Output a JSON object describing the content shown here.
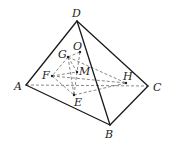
{
  "diagram": {
    "colors": {
      "solid_edge": "#1a1a1a",
      "dashed_edge": "#6a6a6a",
      "label": "#222222",
      "background": "#ffffff"
    },
    "points": {
      "A": {
        "label": "A",
        "x": 26,
        "y": 85
      },
      "B": {
        "label": "B",
        "x": 110,
        "y": 125
      },
      "C": {
        "label": "C",
        "x": 148,
        "y": 86
      },
      "D": {
        "label": "D",
        "x": 77,
        "y": 21
      },
      "O": {
        "label": "O",
        "x": 80,
        "y": 52
      },
      "G": {
        "label": "G",
        "x": 68,
        "y": 57
      },
      "M": {
        "label": "M",
        "x": 77,
        "y": 72
      },
      "F": {
        "label": "F",
        "x": 52,
        "y": 76
      },
      "H": {
        "label": "H",
        "x": 126,
        "y": 83
      },
      "E": {
        "label": "E",
        "x": 74,
        "y": 95
      }
    },
    "solid_edges": [
      [
        "D",
        "A"
      ],
      [
        "D",
        "B"
      ],
      [
        "D",
        "C"
      ],
      [
        "A",
        "B"
      ],
      [
        "B",
        "C"
      ]
    ],
    "dashed_edges": [
      [
        "A",
        "C"
      ],
      [
        "G",
        "O"
      ],
      [
        "O",
        "M"
      ],
      [
        "G",
        "F"
      ],
      [
        "G",
        "M"
      ],
      [
        "G",
        "E"
      ],
      [
        "G",
        "H"
      ],
      [
        "F",
        "H"
      ],
      [
        "F",
        "E"
      ],
      [
        "F",
        "M"
      ],
      [
        "M",
        "E"
      ],
      [
        "E",
        "H"
      ]
    ]
  }
}
